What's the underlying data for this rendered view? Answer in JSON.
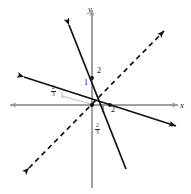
{
  "figure": {
    "kind": "coordinate-plane-line-graph",
    "width": 191,
    "height": 194,
    "background_color": "#ffffff"
  },
  "axes": {
    "x_label": "x",
    "y_label": "y",
    "axis_color": "#9a9a9a",
    "origin_px": {
      "x": 92,
      "y": 105
    },
    "unit_px": 17,
    "x_range_px": {
      "start": 10,
      "end": 178
    },
    "y_range_px": {
      "start": 10,
      "end": 188
    }
  },
  "tick_labels": [
    {
      "text": "1",
      "axis": "y",
      "value": 1,
      "x": 84,
      "y": 83
    },
    {
      "text": "2",
      "axis": "y",
      "value": 2,
      "x": 97,
      "y": 71
    },
    {
      "text": "1",
      "axis": "x",
      "value": 1,
      "x": 101,
      "y": 108
    },
    {
      "text": "2",
      "axis": "x",
      "value": 2,
      "x": 112,
      "y": 108
    }
  ],
  "fraction_labels": [
    {
      "numerator": "2",
      "denominator": "3",
      "position": "x-intercept-left",
      "x": 52,
      "y": 86
    },
    {
      "numerator": "2",
      "denominator": "3",
      "position": "y-intercept-below",
      "x": 95,
      "y": 124
    }
  ],
  "lines": [
    {
      "name": "steep-solid-line",
      "style": "solid",
      "color": "#111111",
      "width": 1.7,
      "x1": 69,
      "y1": 25,
      "x2": 126,
      "y2": 169,
      "arrow_start": true,
      "arrow_end": false
    },
    {
      "name": "shallow-solid-line",
      "style": "solid",
      "color": "#111111",
      "width": 1.7,
      "x1": 24,
      "y1": 77,
      "x2": 176,
      "y2": 126,
      "arrow_start": true,
      "arrow_end": true
    },
    {
      "name": "dashed-diagonal-line",
      "style": "dashed",
      "color": "#111111",
      "width": 1.7,
      "x1": 29,
      "y1": 168,
      "x2": 164,
      "y2": 31,
      "arrow_start": true,
      "arrow_end": true
    }
  ],
  "points": [
    {
      "name": "point-on-y-axis",
      "x": 92,
      "y": 78
    },
    {
      "name": "point-on-x-axis",
      "x": 110,
      "y": 105
    },
    {
      "name": "point-intersection",
      "x": 92,
      "y": 105
    }
  ],
  "leader_lines": [
    {
      "name": "frac-left-leader",
      "x1": 62,
      "y1": 96,
      "x2": 91,
      "y2": 104,
      "color": "#b0b0b0"
    },
    {
      "name": "frac-bottom-leader",
      "x1": 92,
      "y1": 106,
      "x2": 92,
      "y2": 132,
      "color": "#b0b0b0"
    }
  ]
}
